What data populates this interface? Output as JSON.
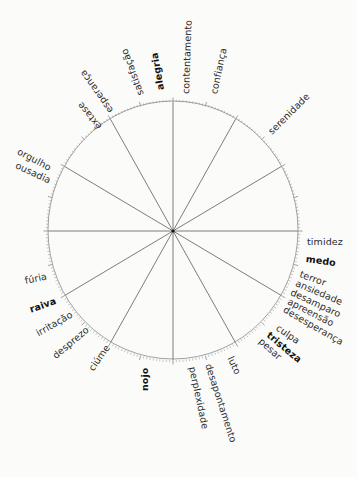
{
  "families": {
    "alegria": {
      "primary": "alegria",
      "items": [
        "contentamento",
        "confiança",
        "satisfação",
        "esperança",
        "êxtase",
        "orgulho",
        "ousadia",
        "serenidade"
      ]
    },
    "medo": {
      "primary": "medo",
      "items": [
        "timidez",
        "terror",
        "ansiedade",
        "desamparo",
        "apreensão",
        "desesperança"
      ]
    },
    "tristeza": {
      "primary": "tristeza",
      "items": [
        "culpa",
        "pesar",
        "luto",
        "desapontamento",
        "perplexidade"
      ]
    },
    "nojo": {
      "primary": "nojo",
      "items": [
        "ciúme",
        "desprezo"
      ]
    },
    "raiva": {
      "primary": "raiva",
      "items": [
        "irritação",
        "fúria"
      ]
    }
  },
  "colors": {
    "line": "#6e6e6e",
    "text": "#2b2b2b",
    "background": "#fbfbfa"
  }
}
